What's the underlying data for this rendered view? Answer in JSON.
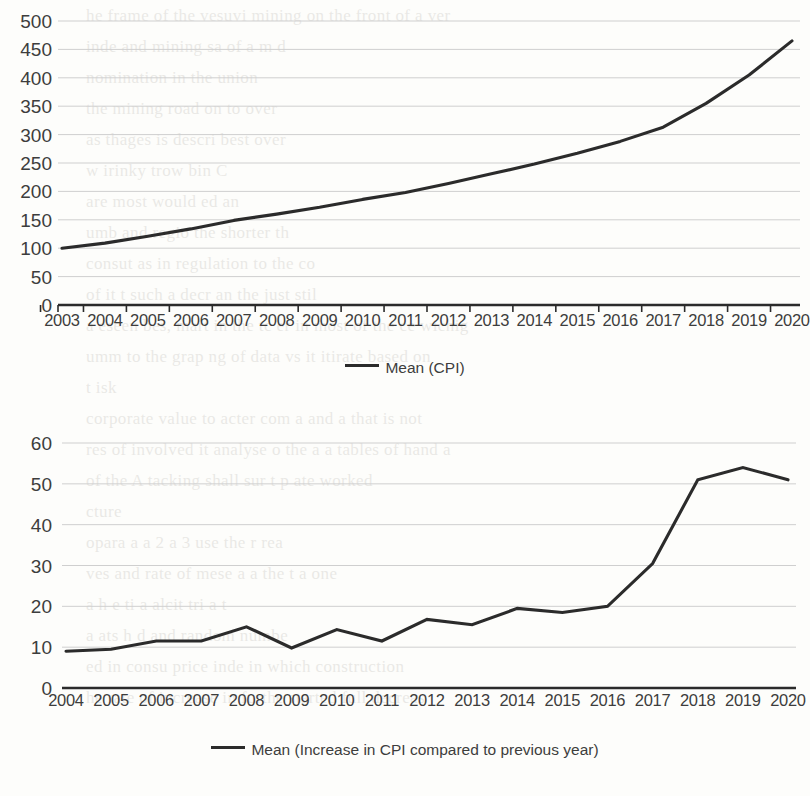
{
  "document": {
    "type": "scanned-page-with-two-line-charts",
    "bleed_through_lines": [
      "he frame of the vesuvi mining on the front of a ver",
      "inde and mining sa of a m d",
      "nomination in the union",
      "the mining road on to over",
      "as thages is descri best over",
      "w  irinky trow bin C",
      "are most would ed an",
      "umb and regio the shorter th",
      "consut as in regulation to the co",
      "of it t such a decr an the  just stil",
      "a  eseen bes, mart in the tc er in most of the ce   wichig",
      "umm  to  the  grap  ng  of  data  vs  it  itirate  based  on",
      "t isk",
      "corporate value to acter  com a and a that is not",
      "res of involved it analyse o  the a  a  tables of  hand a",
      "of  the  A  tacking shall   sur t  p   ate   worked",
      "cture",
      "opara  a  a  2    a   3 use     the  r  rea",
      "ves  and  rate  of mese  a  a  the  t    a  one",
      "  a  h  e  ti   a   alcit   tri  a  t",
      "a   ats   h  d  and  random  numbe",
      "ed    in  consu   price  inde   in  which   construction",
      "he  rate  of  increase   in  furthe  started  full  decreas"
    ]
  },
  "chart_data": [
    {
      "id": "cpi-mean",
      "type": "line",
      "title": "",
      "xlabel": "",
      "ylabel": "",
      "ylim": [
        0,
        500
      ],
      "ytick_step": 50,
      "yticks": [
        500,
        450,
        400,
        350,
        300,
        250,
        200,
        150,
        100,
        50,
        0
      ],
      "grid": true,
      "legend_position": "bottom",
      "legend": [
        "Mean (CPI)"
      ],
      "line_color": "#2b2b2b",
      "categories": [
        "2003",
        "2004",
        "2005",
        "2006",
        "2007",
        "2008",
        "2009",
        "2010",
        "2011",
        "2012",
        "2013",
        "2014",
        "2015",
        "2016",
        "2017",
        "2018",
        "2019",
        "2020"
      ],
      "series": [
        {
          "name": "Mean (CPI)",
          "values": [
            100,
            109,
            121,
            134,
            149,
            160,
            172,
            186,
            198,
            214,
            231,
            248,
            267,
            288,
            313,
            355,
            405,
            465
          ]
        }
      ]
    },
    {
      "id": "cpi-increase-mean",
      "type": "line",
      "title": "",
      "xlabel": "",
      "ylabel": "",
      "ylim": [
        0,
        60
      ],
      "ytick_step": 10,
      "yticks": [
        60,
        50,
        40,
        30,
        20,
        10,
        0
      ],
      "grid": true,
      "legend_position": "bottom",
      "legend": [
        "Mean (Increase in CPI compared to previous year)"
      ],
      "line_color": "#2b2b2b",
      "categories": [
        "2004",
        "2005",
        "2006",
        "2007",
        "2008",
        "2009",
        "2010",
        "2011",
        "2012",
        "2013",
        "2014",
        "2015",
        "2016",
        "2017",
        "2018",
        "2019",
        "2020"
      ],
      "series": [
        {
          "name": "Mean (Increase in CPI compared to previous year)",
          "values": [
            9,
            9.5,
            11.5,
            11.5,
            15,
            9.8,
            14.3,
            11.5,
            16.8,
            15.5,
            19.5,
            18.5,
            20,
            30.5,
            51,
            54,
            51
          ]
        }
      ]
    }
  ]
}
